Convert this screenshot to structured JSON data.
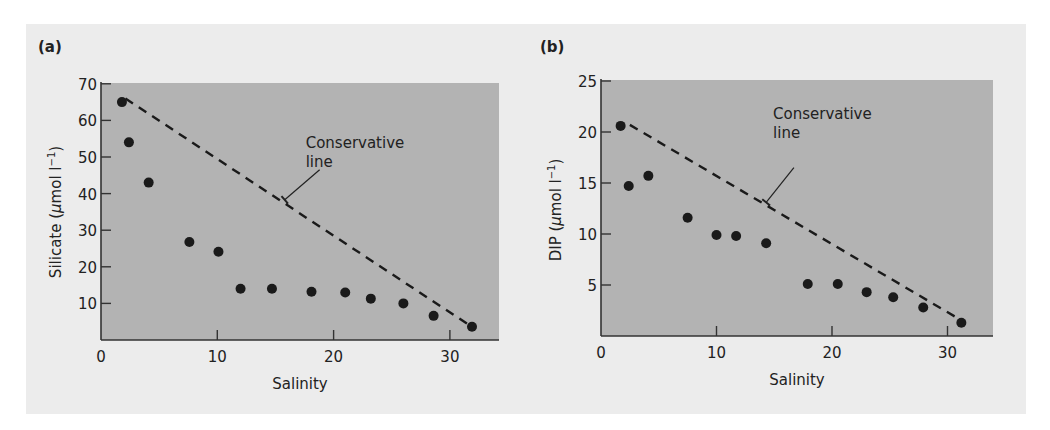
{
  "figure": {
    "panel_background": "#ececec",
    "plot_background": "#b3b3b3",
    "point_color": "#1a1a1a",
    "line_color": "#1a1a1a"
  },
  "chart_data": [
    {
      "type": "scatter",
      "panel_label": "(a)",
      "title": "",
      "xlabel": "Salinity",
      "ylabel": "Silicate (μmol l⁻¹)",
      "ylabel_parts": {
        "pre": "Silicate (",
        "mu": "μ",
        "post": "mol l",
        "sup": "−1",
        "close": ")"
      },
      "xlim": [
        0,
        34
      ],
      "ylim": [
        0,
        70
      ],
      "xticks": [
        0,
        10,
        20,
        30
      ],
      "yticks": [
        10,
        20,
        30,
        40,
        50,
        60,
        70
      ],
      "grid": false,
      "series": [
        {
          "name": "Observed",
          "x": [
            1.8,
            2.4,
            4.1,
            7.6,
            10.1,
            12.0,
            14.7,
            18.1,
            21.0,
            23.2,
            26.0,
            28.6,
            31.9
          ],
          "y": [
            65,
            54,
            43,
            26.8,
            24.1,
            14,
            14,
            13.2,
            13,
            11.3,
            10,
            6.6,
            3.6
          ]
        },
        {
          "name": "Conservative line",
          "style": "dashed",
          "x": [
            2.1,
            31.6
          ],
          "y": [
            66,
            4.2
          ]
        }
      ],
      "annotations": [
        {
          "text_lines": [
            "Conservative",
            "line"
          ],
          "text_xy": [
            17.6,
            52.5
          ],
          "arrow_from": [
            18.8,
            46.5
          ],
          "arrow_to": [
            15.8,
            38.3
          ]
        }
      ]
    },
    {
      "type": "scatter",
      "panel_label": "(b)",
      "title": "",
      "xlabel": "Salinity",
      "ylabel": "DIP (μmol l⁻¹)",
      "ylabel_parts": {
        "pre": "DIP (",
        "mu": "μ",
        "post": "mol l",
        "sup": "−1",
        "close": ")"
      },
      "xlim": [
        0,
        34
      ],
      "ylim": [
        0,
        25
      ],
      "xticks": [
        0,
        10,
        20,
        30
      ],
      "yticks": [
        5,
        10,
        15,
        20,
        25
      ],
      "grid": false,
      "series": [
        {
          "name": "Observed",
          "x": [
            1.7,
            2.4,
            4.1,
            7.5,
            10.0,
            11.7,
            14.3,
            17.9,
            20.5,
            23.0,
            25.3,
            27.9,
            31.2
          ],
          "y": [
            20.6,
            14.7,
            15.7,
            11.6,
            9.9,
            9.8,
            9.1,
            5.1,
            5.1,
            4.3,
            3.8,
            2.8,
            1.3
          ]
        },
        {
          "name": "Conservative line",
          "style": "dashed",
          "x": [
            2.5,
            30.8
          ],
          "y": [
            20.7,
            1.8
          ]
        }
      ],
      "annotations": [
        {
          "text_lines": [
            "Conservative",
            "line"
          ],
          "text_xy": [
            14.9,
            21.3
          ],
          "arrow_from": [
            16.7,
            16.5
          ],
          "arrow_to": [
            14.3,
            13.1
          ]
        }
      ]
    }
  ]
}
